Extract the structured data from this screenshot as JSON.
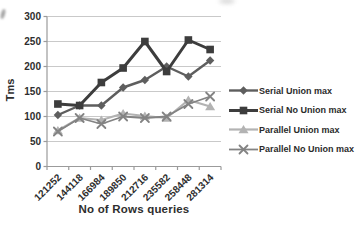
{
  "chart_data": {
    "type": "line",
    "title": "",
    "xlabel": "No of Rows queries",
    "ylabel": "Tms",
    "ylim": [
      0,
      300
    ],
    "yticks": [
      0,
      50,
      100,
      150,
      200,
      250,
      300
    ],
    "grid": true,
    "legend_position": "right",
    "categories": [
      "121252",
      "144118",
      "166984",
      "189850",
      "212716",
      "235582",
      "258448",
      "281314"
    ],
    "series": [
      {
        "name": "Serial Union max",
        "marker": "diamond",
        "color": "#5e5e5e",
        "values": [
          103,
          122,
          122,
          158,
          173,
          200,
          180,
          212
        ]
      },
      {
        "name": "Serial No Union max",
        "marker": "square",
        "color": "#3d3d3d",
        "values": [
          125,
          122,
          168,
          197,
          250,
          190,
          253,
          234
        ]
      },
      {
        "name": "Parallel Union max",
        "marker": "triangle",
        "color": "#b3b3b3",
        "values": [
          72,
          97,
          93,
          106,
          101,
          97,
          133,
          120
        ]
      },
      {
        "name": "Parallel No Union max",
        "marker": "x",
        "color": "#838383",
        "values": [
          70,
          97,
          85,
          100,
          97,
          100,
          125,
          140
        ]
      }
    ]
  },
  "colors": {
    "background": "#ffffff",
    "gridline": "#c9c9c9",
    "axis": "#9b9b9b",
    "text": "#2e2e2e"
  }
}
